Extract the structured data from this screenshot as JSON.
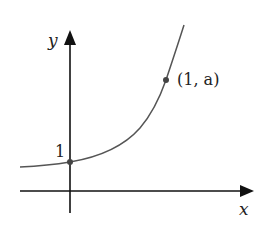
{
  "diagram": {
    "type": "exponential-graph",
    "function": "y = a^x",
    "axes": {
      "x_label": "x",
      "y_label": "y"
    },
    "labels": {
      "y_intercept": "1",
      "point_label": "(1, a)"
    },
    "points": [
      {
        "name": "y-intercept",
        "coords": "(0, 1)"
      },
      {
        "name": "point-a",
        "coords": "(1, a)"
      }
    ],
    "colors": {
      "axis": "#111111",
      "curve": "#555555",
      "point": "#444444"
    }
  }
}
